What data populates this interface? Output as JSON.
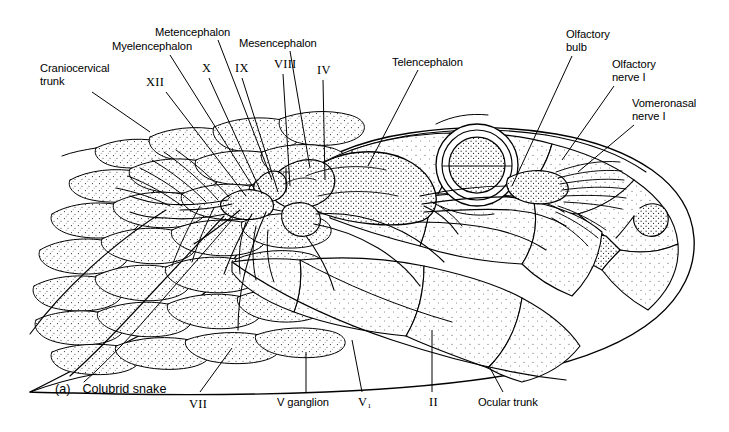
{
  "figure": {
    "caption_tag": "(a)",
    "caption_text": "Colubrid snake",
    "ink_color": "#000000",
    "background_color": "#ffffff"
  },
  "labels": [
    {
      "id": "craniocervical-trunk",
      "text": "Craniocervical\ntrunk",
      "style": "word",
      "x": 40,
      "y": 62,
      "align": "left",
      "leader": [
        [
          92,
          92
        ],
        [
          150,
          132
        ]
      ]
    },
    {
      "id": "myelencephalon",
      "text": "Myelencephalon",
      "style": "word",
      "x": 112,
      "y": 40,
      "align": "left",
      "leader": [
        [
          170,
          55
        ],
        [
          255,
          190
        ]
      ]
    },
    {
      "id": "metencephalon",
      "text": "Metencephalon",
      "style": "word",
      "x": 155,
      "y": 26,
      "align": "left",
      "leader": [
        [
          218,
          40
        ],
        [
          272,
          180
        ]
      ]
    },
    {
      "id": "mesencephalon",
      "text": "Mesencephalon",
      "style": "word",
      "x": 239,
      "y": 37,
      "align": "left",
      "leader": [
        [
          290,
          51
        ],
        [
          310,
          168
        ]
      ]
    },
    {
      "id": "telencephalon",
      "text": "Telencephalon",
      "style": "word",
      "x": 392,
      "y": 56,
      "align": "left",
      "leader": [
        [
          418,
          70
        ],
        [
          368,
          166
        ]
      ]
    },
    {
      "id": "olfactory-bulb",
      "text": "Olfactory\nbulb",
      "style": "word",
      "x": 566,
      "y": 28,
      "align": "left",
      "leader": [
        [
          572,
          56
        ],
        [
          512,
          186
        ]
      ]
    },
    {
      "id": "olfactory-nerve-i",
      "text": "Olfactory\nnerve I",
      "style": "word",
      "x": 612,
      "y": 58,
      "align": "left",
      "leader": [
        [
          614,
          86
        ],
        [
          562,
          160
        ]
      ]
    },
    {
      "id": "vomeronasal-nerve-i",
      "text": "Vomeronasal\nnerve I",
      "style": "word",
      "x": 632,
      "y": 97,
      "align": "left",
      "leader": [
        [
          634,
          125
        ],
        [
          578,
          172
        ]
      ]
    },
    {
      "id": "cranial-nerve-xii",
      "text": "XII",
      "style": "roman",
      "x": 146,
      "y": 76,
      "align": "left",
      "leader": [
        [
          166,
          92
        ],
        [
          246,
          196
        ]
      ]
    },
    {
      "id": "cranial-nerve-x",
      "text": "X",
      "style": "roman",
      "x": 202,
      "y": 62,
      "align": "left",
      "leader": [
        [
          209,
          78
        ],
        [
          262,
          194
        ]
      ]
    },
    {
      "id": "cranial-nerve-ix",
      "text": "IX",
      "style": "roman",
      "x": 235,
      "y": 62,
      "align": "left",
      "leader": [
        [
          242,
          78
        ],
        [
          278,
          192
        ]
      ]
    },
    {
      "id": "cranial-nerve-viii",
      "text": "VIII",
      "style": "roman",
      "x": 274,
      "y": 58,
      "align": "left",
      "leader": [
        [
          283,
          74
        ],
        [
          290,
          186
        ]
      ]
    },
    {
      "id": "cranial-nerve-iv",
      "text": "IV",
      "style": "roman",
      "x": 317,
      "y": 64,
      "align": "left",
      "leader": [
        [
          323,
          80
        ],
        [
          325,
          180
        ]
      ]
    },
    {
      "id": "cranial-nerve-vii",
      "text": "VII",
      "style": "roman",
      "x": 189,
      "y": 398,
      "align": "left",
      "leader": [
        [
          200,
          392
        ],
        [
          232,
          348
        ]
      ]
    },
    {
      "id": "v-ganglion",
      "text": "V ganglion",
      "style": "word",
      "x": 277,
      "y": 396,
      "align": "left",
      "leader": [
        [
          306,
          392
        ],
        [
          306,
          352
        ]
      ]
    },
    {
      "id": "cranial-nerve-v1",
      "text": "V₁",
      "style": "roman",
      "x": 358,
      "y": 396,
      "align": "left",
      "leader": [
        [
          362,
          392
        ],
        [
          352,
          340
        ]
      ]
    },
    {
      "id": "cranial-nerve-ii",
      "text": "II",
      "style": "roman",
      "x": 429,
      "y": 396,
      "align": "left",
      "leader": [
        [
          432,
          392
        ],
        [
          432,
          330
        ]
      ]
    },
    {
      "id": "ocular-trunk",
      "text": "Ocular trunk",
      "style": "word",
      "x": 478,
      "y": 396,
      "align": "left",
      "leader": [
        [
          503,
          392
        ],
        [
          490,
          368
        ]
      ]
    }
  ]
}
